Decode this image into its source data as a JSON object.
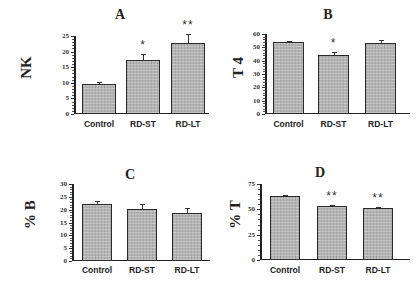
{
  "chart_data": [
    {
      "type": "bar",
      "panel": "A",
      "title": "A",
      "ylabel": "NK",
      "xlabel": "",
      "categories": [
        "Control",
        "RD-ST",
        "RD-LT"
      ],
      "values": [
        9.5,
        17.3,
        22.7
      ],
      "errors": [
        0.9,
        2.0,
        2.8
      ],
      "significance": [
        "",
        "*",
        "**"
      ],
      "ylim": [
        0,
        25
      ],
      "yticks": [
        0,
        5,
        10,
        15,
        20,
        25
      ],
      "grid": false
    },
    {
      "type": "bar",
      "panel": "B",
      "title": "B",
      "ylabel": "T 4",
      "xlabel": "",
      "categories": [
        "Control",
        "RD-ST",
        "RD-LT"
      ],
      "values": [
        54,
        44.5,
        53.5
      ],
      "errors": [
        1.0,
        2.0,
        2.0
      ],
      "significance": [
        "",
        "*",
        ""
      ],
      "ylim": [
        0,
        60
      ],
      "yticks": [
        0,
        10,
        20,
        30,
        40,
        50,
        60
      ],
      "grid": false
    },
    {
      "type": "bar",
      "panel": "C",
      "title": "C",
      "ylabel": "% B",
      "xlabel": "",
      "categories": [
        "Control",
        "RD-ST",
        "RD-LT"
      ],
      "values": [
        22.3,
        20.3,
        18.6
      ],
      "errors": [
        1.2,
        1.8,
        2.0
      ],
      "significance": [
        "",
        "",
        ""
      ],
      "ylim": [
        0,
        30
      ],
      "yticks": [
        0,
        5,
        10,
        15,
        20,
        25,
        30
      ],
      "grid": false
    },
    {
      "type": "bar",
      "panel": "D",
      "title": "D",
      "ylabel": "% T",
      "xlabel": "",
      "categories": [
        "Control",
        "RD-ST",
        "RD-LT"
      ],
      "values": [
        63,
        53,
        51
      ],
      "errors": [
        1.0,
        1.0,
        1.5
      ],
      "significance": [
        "",
        "**",
        "**"
      ],
      "ylim": [
        0,
        75
      ],
      "yticks": [
        0,
        25,
        50,
        75
      ],
      "grid": false
    }
  ],
  "panels": {
    "A": {
      "title": "A",
      "ylabel": "NK",
      "ticks": [
        "0",
        "5",
        "10",
        "15",
        "20",
        "25"
      ],
      "cats": [
        "Control",
        "RD-ST",
        "RD-LT"
      ],
      "sig": [
        "",
        "*",
        "**"
      ]
    },
    "B": {
      "title": "B",
      "ylabel": "T 4",
      "ticks": [
        "0",
        "10",
        "20",
        "30",
        "40",
        "50",
        "60"
      ],
      "cats": [
        "Control",
        "RD-ST",
        "RD-LT"
      ],
      "sig": [
        "",
        "*",
        ""
      ]
    },
    "C": {
      "title": "C",
      "ylabel": "% B",
      "ticks": [
        "0",
        "5",
        "10",
        "15",
        "20",
        "25",
        "30"
      ],
      "cats": [
        "Control",
        "RD-ST",
        "RD-LT"
      ],
      "sig": [
        "",
        "",
        ""
      ]
    },
    "D": {
      "title": "D",
      "ylabel": "% T",
      "ticks": [
        "0",
        "25",
        "50",
        "75"
      ],
      "cats": [
        "Control",
        "RD-ST",
        "RD-LT"
      ],
      "sig": [
        "",
        "**",
        "**"
      ]
    }
  }
}
